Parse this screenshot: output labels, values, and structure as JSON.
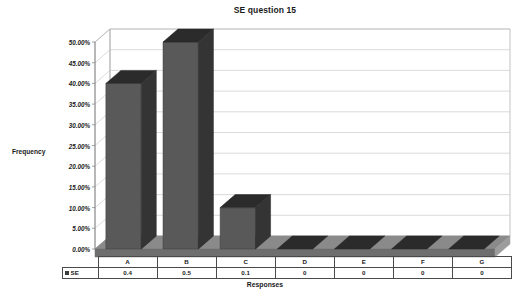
{
  "chart_data": {
    "type": "bar",
    "title": "SE question 15",
    "xlabel": "Responses",
    "ylabel": "Frequency",
    "categories": [
      "A",
      "B",
      "C",
      "D",
      "E",
      "F",
      "G"
    ],
    "values": [
      0.4,
      0.5,
      0.1,
      0,
      0,
      0,
      0
    ],
    "value_labels": [
      "0.4",
      "0.5",
      "0.1",
      "0",
      "0",
      "0",
      "0"
    ],
    "series": [
      {
        "name": "SE",
        "values": [
          0.4,
          0.5,
          0.1,
          0,
          0,
          0,
          0
        ]
      }
    ],
    "ylim": [
      0,
      0.5
    ],
    "ytick_values": [
      0,
      0.05,
      0.1,
      0.15,
      0.2,
      0.25,
      0.3,
      0.35,
      0.4,
      0.45,
      0.5
    ],
    "ytick_labels": [
      "0.00%",
      "5.00%",
      "10.00%",
      "15.00%",
      "20.00%",
      "25.00%",
      "30.00%",
      "35.00%",
      "40.00%",
      "45.00%",
      "50.00%"
    ],
    "grid": true,
    "grid_axis": "y",
    "legend_position": "data-table-row-header",
    "style": "3d-column",
    "colors": {
      "bar_front": "#595959",
      "bar_top": "#2b2b2b",
      "bar_side": "#343434",
      "floor": "#8a8a8a",
      "floor_front": "#6e6e6e",
      "gridline": "#cccccc",
      "wall_border": "#aaaaaa",
      "axis": "#7a7a7a",
      "table_border": "#4a4a4a",
      "text": "#1a1a1a",
      "background": "#ffffff",
      "legend_swatch": "#3b3b3b"
    }
  },
  "table": {
    "header_row": [
      "A",
      "B",
      "C",
      "D",
      "E",
      "F",
      "G"
    ],
    "legend_label": "SE",
    "value_row": [
      "0.4",
      "0.5",
      "0.1",
      "0",
      "0",
      "0",
      "0"
    ]
  },
  "icons": {
    "legend_swatch": "square-marker-icon"
  }
}
